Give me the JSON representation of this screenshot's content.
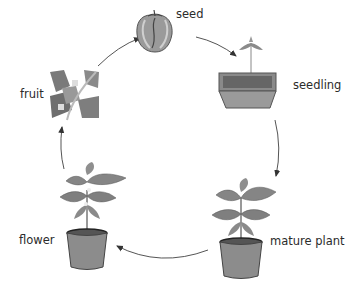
{
  "diagram": {
    "title": "",
    "type": "life-cycle",
    "stages": [
      {
        "id": "seed",
        "label": "seed"
      },
      {
        "id": "seedling",
        "label": "seedling"
      },
      {
        "id": "mature_plant",
        "label": "mature plant"
      },
      {
        "id": "flower",
        "label": "flower"
      },
      {
        "id": "fruit",
        "label": "fruit"
      }
    ],
    "flow": [
      "seed",
      "seedling",
      "mature plant",
      "flower",
      "fruit",
      "seed"
    ],
    "colors": {
      "line": "#555555",
      "pot": "#8c8c8c",
      "pot_rim": "#3a3a3a",
      "leaf": "#7d7d7d",
      "soil": "#6e6e6e"
    }
  }
}
